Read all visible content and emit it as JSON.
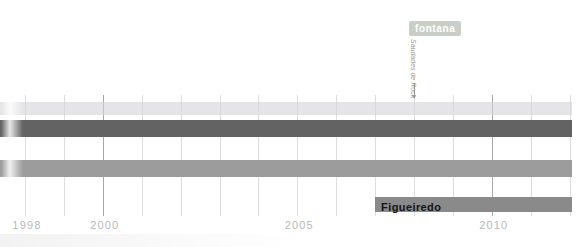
{
  "page": {
    "background": "#ffffff"
  },
  "chart_data": {
    "type": "bar",
    "subtype": "band-membership-timeline",
    "title": "",
    "xlabel": "",
    "ylabel": "",
    "x_axis": {
      "unit": "year",
      "visible_range": [
        1997.35,
        2012.4
      ],
      "gridline_interval": 1,
      "labeled_ticks": [
        {
          "year": 1998,
          "label": "1998"
        },
        {
          "year": 2000,
          "label": "2000"
        },
        {
          "year": 2005,
          "label": "2005"
        },
        {
          "year": 2010,
          "label": "2010"
        }
      ],
      "emphasized_gridline_years": [
        2000,
        2010
      ],
      "gridline_color": "#dcdcdc",
      "emphasized_gridline_color": "#a8a8a8",
      "tick_label_color": "#b9b9b9"
    },
    "rows": [
      {
        "id": "row-1",
        "label": "",
        "start_year": 1997.35,
        "start_clipped": true,
        "end_year": 2012.05,
        "color": "rgba(213,213,217,0.62)"
      },
      {
        "id": "row-2",
        "label": "",
        "start_year": 1997.35,
        "start_clipped": true,
        "end_year": 2012.05,
        "color": "#636363"
      },
      {
        "id": "row-3",
        "label": "",
        "start_year": 1997.35,
        "start_clipped": true,
        "end_year": 2012.05,
        "color": "#9c9c9c"
      },
      {
        "id": "row-4",
        "label": "Figueiredo",
        "start_year": 2007,
        "end_year": 2012.05,
        "color": "#8a8a8a",
        "label_color": "#141414"
      }
    ],
    "annotations": [
      {
        "badge": "fontana",
        "badge_bg": "#c9cfc6",
        "badge_text_color": "#ffffff",
        "note": "Saudades de Rock",
        "note_color": "#9a9a9a",
        "year": 2008,
        "arrow_color": "#999999",
        "points_to_row": "row-1"
      }
    ]
  }
}
